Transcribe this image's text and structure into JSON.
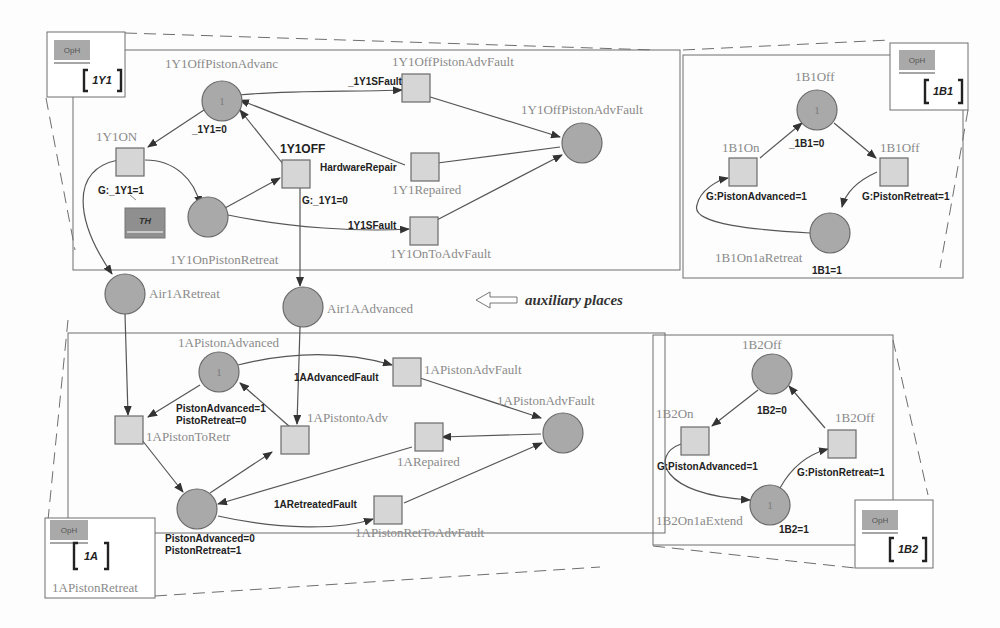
{
  "annotation": {
    "text": "auxiliary places",
    "icon": "hollow-arrow-left-icon"
  },
  "opboxes": [
    {
      "button": "OpH",
      "name": "1Y1"
    },
    {
      "button": "OpH",
      "name": "1B1"
    },
    {
      "button": "OpH",
      "name": "1A",
      "caption": "1APistonRetreat"
    },
    {
      "button": "OpH",
      "name": "1B2"
    }
  ],
  "th_box": {
    "label": "TH"
  },
  "panel_1y1": {
    "places": [
      {
        "name": "1Y1OffPistonAdvanc",
        "tokens": "1"
      },
      {
        "name": "1Y1OnPistonRetreat",
        "tokens": ""
      },
      {
        "name": "1Y1OffPistonAdvFault",
        "tokens": ""
      }
    ],
    "transitions": [
      {
        "name": "1Y1ON",
        "guard": "G:_1Y1=1"
      },
      {
        "name": "1Y1OFF",
        "guard": "G:_1Y1=0"
      },
      {
        "name": "1Y1OffPistonAdvFault",
        "event": "_1Y1SFault"
      },
      {
        "name": "1Y1Repaired",
        "event": "HardwareRepair"
      },
      {
        "name": "1Y1OnToAdvFault",
        "event": "1Y1SFault"
      }
    ],
    "arc_labels": [
      "_1Y1=0"
    ]
  },
  "aux_places": [
    {
      "name": "Air1ARetreat"
    },
    {
      "name": "Air1AAdvanced"
    }
  ],
  "panel_1a": {
    "places": [
      {
        "name": "1APistonAdvanced",
        "tokens": "1",
        "note": [
          "PistonAdvanced=1",
          "PistoRetreat=0"
        ]
      },
      {
        "name": "1APistonAdvFault",
        "tokens": ""
      },
      {
        "name": "1APistonRetreat",
        "tokens": "",
        "note": [
          "PistonAdvanced=0",
          "PistonRetreat=1"
        ]
      }
    ],
    "transitions": [
      {
        "name": "1APistonToRetr"
      },
      {
        "name": "1APistontoAdv"
      },
      {
        "name": "1APistonAdvFault",
        "event": "1AAdvancedFault"
      },
      {
        "name": "1ARepaired"
      },
      {
        "name": "1APistonRetToAdvFault",
        "event": "1ARetreatedFault"
      }
    ]
  },
  "panel_1b1": {
    "places": [
      {
        "name": "1B1Off",
        "tokens": "1"
      },
      {
        "name": "1B1On1aRetreat",
        "tokens": "",
        "note": "1B1=1"
      }
    ],
    "transitions": [
      {
        "name": "1B1On",
        "guard": "G:PistonAdvanced=1"
      },
      {
        "name": "1B1Off",
        "guard": "G:PistonRetreat=1"
      }
    ],
    "arc_labels": [
      "_1B1=0"
    ]
  },
  "panel_1b2": {
    "places": [
      {
        "name": "1B2Off",
        "tokens": "",
        "note": "1B2=0"
      },
      {
        "name": "1B2On1aExtend",
        "tokens": "1",
        "note": "1B2=1"
      }
    ],
    "transitions": [
      {
        "name": "1B2On",
        "guard": "G:PistonAdvanced=1"
      },
      {
        "name": "1B2Off",
        "guard": "G:PistonRetreat=1"
      }
    ]
  }
}
